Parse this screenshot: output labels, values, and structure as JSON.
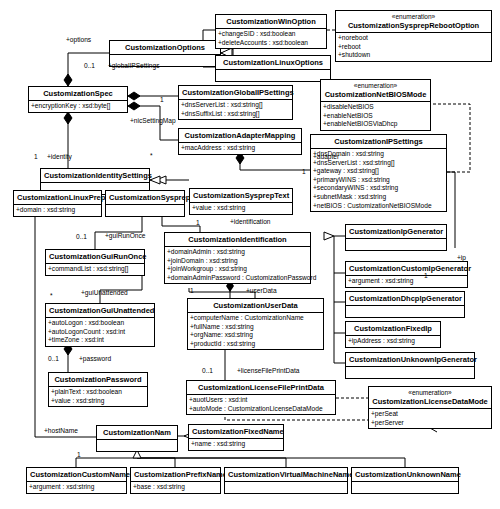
{
  "diagram": {
    "type": "uml-class-diagram"
  },
  "classes": [
    {
      "id": "options",
      "name": "CustomizationOptions",
      "stereotype": "",
      "attrs": [],
      "x": 109,
      "y": 40,
      "w": 112,
      "h": 26
    },
    {
      "id": "winoption",
      "name": "CustomizationWinOption",
      "stereotype": "",
      "attrs": [
        "+changeSID : xsd:boolean",
        "+deleteAccounts : xsd:boolean"
      ],
      "x": 215,
      "y": 14,
      "w": 112,
      "h": 32
    },
    {
      "id": "linuxoptions",
      "name": "CustomizationLinuxOptions",
      "stereotype": "",
      "attrs": [],
      "x": 215,
      "y": 55,
      "w": 116,
      "h": 24
    },
    {
      "id": "rebootopt",
      "name": "CustomizationSysprepRebootOption",
      "stereotype": "«enumeration»",
      "attrs": [
        "+noreboot",
        "+reboot",
        "+shutdown"
      ],
      "x": 335,
      "y": 10,
      "w": 157,
      "h": 50
    },
    {
      "id": "spec",
      "name": "CustomizationSpec",
      "stereotype": "",
      "attrs": [
        "+encryptionKey : xsd:byte[]"
      ],
      "x": 28,
      "y": 86,
      "w": 100,
      "h": 26
    },
    {
      "id": "globalip",
      "name": "CustomizationGlobalIPSettings",
      "stereotype": "",
      "attrs": [
        "+dnsServerList : xsd:string[]",
        "+dnsSuffixList : xsd:string[]"
      ],
      "x": 178,
      "y": 85,
      "w": 115,
      "h": 32
    },
    {
      "id": "netbiosmode",
      "name": "CustomizationNetBIOSMode",
      "stereotype": "«enumeration»",
      "attrs": [
        "+disableNetBIOS",
        "+enableNetBIOS",
        "+enableNetBIOSViaDhcp"
      ],
      "x": 320,
      "y": 79,
      "w": 111,
      "h": 50
    },
    {
      "id": "adapter",
      "name": "CustomizationAdapterMapping",
      "stereotype": "",
      "attrs": [
        "+macAddress : xsd:string"
      ],
      "x": 178,
      "y": 128,
      "w": 124,
      "h": 24
    },
    {
      "id": "ipsettings",
      "name": "CustomizationIPSettings",
      "stereotype": "",
      "attrs": [
        "+dnsDomain : xsd:string",
        "+dnsServerList : xsd:string[]",
        "+gateway : xsd:string[]",
        "+primaryWINS : xsd:string",
        "+secondaryWINS : xsd:string",
        "+subnetMask : xsd:string",
        "+netBIOS : CustomizationNetBIOSMode"
      ],
      "x": 310,
      "y": 134,
      "w": 137,
      "h": 77
    },
    {
      "id": "identitysettings",
      "name": "CustomizationIdentitySettings",
      "stereotype": "",
      "attrs": [],
      "x": 40,
      "y": 168,
      "w": 110,
      "h": 24
    },
    {
      "id": "linuxprep",
      "name": "CustomizationLinuxPrep",
      "stereotype": "",
      "attrs": [
        "+domain : xsd:string"
      ],
      "x": 13,
      "y": 190,
      "w": 89,
      "h": 26
    },
    {
      "id": "sysprep",
      "name": "CustomizationSysprep",
      "stereotype": "",
      "attrs": [],
      "x": 105,
      "y": 190,
      "w": 80,
      "h": 26
    },
    {
      "id": "sysprepetext",
      "name": "CustomizationSysprepText",
      "stereotype": "",
      "attrs": [
        "+value : xsd:string"
      ],
      "x": 189,
      "y": 188,
      "w": 104,
      "h": 26
    },
    {
      "id": "identification",
      "name": "CustomizationIdentification",
      "stereotype": "",
      "attrs": [
        "+domainAdmin : xsd:string",
        "+joinDomain : xsd:string",
        "+joinWorkgroup : xsd:string",
        "+domainAdminPassword : CustomizationPassword"
      ],
      "x": 164,
      "y": 232,
      "w": 147,
      "h": 48
    },
    {
      "id": "ipgenerator",
      "name": "CustomizationIpGenerator",
      "stereotype": "",
      "attrs": [],
      "x": 345,
      "y": 224,
      "w": 102,
      "h": 24
    },
    {
      "id": "customip",
      "name": "CustomizationCustomIpGenerator",
      "stereotype": "",
      "attrs": [
        "+argument : xsd:string"
      ],
      "x": 345,
      "y": 261,
      "w": 123,
      "h": 24
    },
    {
      "id": "dhcpip",
      "name": "CustomizationDhcpIpGenerator",
      "stereotype": "",
      "attrs": [],
      "x": 345,
      "y": 291,
      "w": 120,
      "h": 22
    },
    {
      "id": "fixedip",
      "name": "CustomizationFixedIp",
      "stereotype": "",
      "attrs": [
        "+ipAddress : xsd:string"
      ],
      "x": 345,
      "y": 321,
      "w": 96,
      "h": 24
    },
    {
      "id": "unknownip",
      "name": "CustomizationUnknownIpGenerator",
      "stereotype": "",
      "attrs": [],
      "x": 345,
      "y": 352,
      "w": 130,
      "h": 22
    },
    {
      "id": "guirunonce",
      "name": "CustomizationGuiRunOnce",
      "stereotype": "",
      "attrs": [
        "+commandList : xsd:string[]"
      ],
      "x": 45,
      "y": 249,
      "w": 100,
      "h": 26
    },
    {
      "id": "guiunattended",
      "name": "CustomizationGuiUnattended",
      "stereotype": "",
      "attrs": [
        "+autoLogon : xsd:boolean",
        "+autoLogonCount : xsd:int",
        "+timeZone : xsd:int"
      ],
      "x": 45,
      "y": 303,
      "w": 110,
      "h": 40
    },
    {
      "id": "password",
      "name": "CustomizationPassword",
      "stereotype": "",
      "attrs": [
        "+plainText : xsd:boolean",
        "+value : xsd:string"
      ],
      "x": 48,
      "y": 372,
      "w": 100,
      "h": 32
    },
    {
      "id": "userdata",
      "name": "CustomizationUserData",
      "stereotype": "",
      "attrs": [
        "+computerName : CustomizationName",
        "+fullName : xsd:string",
        "+orgName: xsd:string",
        "+productId : xsd:string"
      ],
      "x": 187,
      "y": 298,
      "w": 137,
      "h": 48
    },
    {
      "id": "licensefile",
      "name": "CustomizationLicenseFilePrintData",
      "stereotype": "",
      "attrs": [
        "+auotUsers : xsd:int",
        "+autoMode : CustomizationLicenseDataMode"
      ],
      "x": 186,
      "y": 380,
      "w": 150,
      "h": 32
    },
    {
      "id": "licensemode",
      "name": "CustomizationLicenseDataMode",
      "stereotype": "«enumeration»",
      "attrs": [
        "+perSeat",
        "+perServer"
      ],
      "x": 368,
      "y": 386,
      "w": 124,
      "h": 42
    },
    {
      "id": "nam",
      "name": "CustomizationNam",
      "stereotype": "",
      "attrs": [],
      "x": 96,
      "y": 425,
      "w": 82,
      "h": 24
    },
    {
      "id": "fixedname",
      "name": "CustomizationFixedName",
      "stereotype": "",
      "attrs": [
        "+name : xsd:string"
      ],
      "x": 188,
      "y": 424,
      "w": 96,
      "h": 24
    },
    {
      "id": "customname",
      "name": "CustomizationCustomName",
      "stereotype": "",
      "attrs": [
        "+argument : xsd:string"
      ],
      "x": 26,
      "y": 467,
      "w": 101,
      "h": 26
    },
    {
      "id": "prefixname",
      "name": "CustomizationPrefixName",
      "stereotype": "",
      "attrs": [
        "+base : xsd:string"
      ],
      "x": 130,
      "y": 467,
      "w": 91,
      "h": 26
    },
    {
      "id": "vmname",
      "name": "CustomizationVirtualMachineName",
      "stereotype": "",
      "attrs": [],
      "x": 224,
      "y": 467,
      "w": 124,
      "h": 26
    },
    {
      "id": "unknownname",
      "name": "CustomizationUnknownName",
      "stereotype": "",
      "attrs": [],
      "x": 351,
      "y": 467,
      "w": 108,
      "h": 26
    }
  ],
  "edge_labels": [
    {
      "text": "+options",
      "x": 66,
      "y": 36
    },
    {
      "text": "0..1",
      "x": 84,
      "y": 62
    },
    {
      "text": "+globalIPSettings",
      "x": 108,
      "y": 62
    },
    {
      "text": "1",
      "x": 160,
      "y": 96
    },
    {
      "text": "+nicSettingMap",
      "x": 130,
      "y": 117
    },
    {
      "text": "+identity",
      "x": 47,
      "y": 153
    },
    {
      "text": "1",
      "x": 34,
      "y": 153
    },
    {
      "text": "*",
      "x": 150,
      "y": 152
    },
    {
      "text": "+adapter",
      "x": 313,
      "y": 153
    },
    {
      "text": "1",
      "x": 302,
      "y": 168
    },
    {
      "text": "+identification",
      "x": 230,
      "y": 218
    },
    {
      "text": "1",
      "x": 196,
      "y": 219
    },
    {
      "text": "0..1",
      "x": 76,
      "y": 233
    },
    {
      "text": "+guiRunOnce",
      "x": 105,
      "y": 232
    },
    {
      "text": "*",
      "x": 50,
      "y": 292
    },
    {
      "text": "+guiUnattended",
      "x": 81,
      "y": 289
    },
    {
      "text": "0..1",
      "x": 48,
      "y": 355
    },
    {
      "text": "+password",
      "x": 79,
      "y": 355
    },
    {
      "text": "+hostName",
      "x": 44,
      "y": 427
    },
    {
      "text": "1",
      "x": 77,
      "y": 451
    },
    {
      "text": "1",
      "x": 190,
      "y": 287
    },
    {
      "text": "+userData",
      "x": 246,
      "y": 287
    },
    {
      "text": "0..1",
      "x": 202,
      "y": 367
    },
    {
      "text": "+licenseFilePrintData",
      "x": 237,
      "y": 367
    },
    {
      "text": "1",
      "x": 424,
      "y": 272
    },
    {
      "text": "+ip",
      "x": 457,
      "y": 254
    }
  ]
}
